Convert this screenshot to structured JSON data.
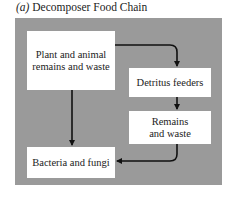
{
  "title": {
    "label": "(a)",
    "text": "Decomposer Food Chain"
  },
  "nodes": [
    {
      "id": "plant",
      "label": "Plant and animal remains and waste"
    },
    {
      "id": "detritus",
      "label": "Detritus feeders"
    },
    {
      "id": "remains",
      "label": "Remains and waste"
    },
    {
      "id": "bacteria",
      "label": "Bacteria and fungi"
    }
  ],
  "edges": [
    {
      "from": "plant",
      "to": "detritus"
    },
    {
      "from": "detritus",
      "to": "remains"
    },
    {
      "from": "remains",
      "to": "bacteria"
    },
    {
      "from": "plant",
      "to": "bacteria"
    }
  ],
  "colors": {
    "panel": "#9a9a9a",
    "box": "#ffffff",
    "arrow": "#111111"
  }
}
